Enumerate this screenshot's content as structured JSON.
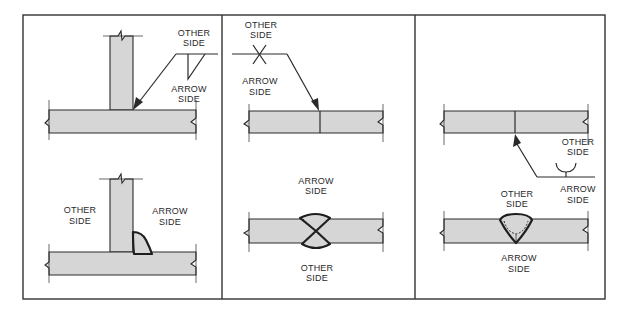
{
  "diagram": {
    "colors": {
      "frame": "#333333",
      "plate_fill": "#d6d6d6",
      "ink": "#2a2a2a",
      "background": "#ffffff"
    },
    "panels": [
      {
        "id": "tee-fillet",
        "description": "T-joint with fillet weld symbol below reference line (arrow side)",
        "symbol": {
          "type": "fillet",
          "position": "below-reference-line",
          "labels": {
            "above": "OTHER SIDE",
            "below": "ARROW SIDE"
          },
          "above_lines": [
            "OTHER",
            "SIDE"
          ],
          "below_lines": [
            "ARROW",
            "SIDE"
          ]
        },
        "joint": {
          "type": "tee-fillet",
          "labels": {
            "left_lines": [
              "OTHER",
              "SIDE"
            ],
            "right_lines": [
              "ARROW",
              "SIDE"
            ]
          }
        }
      },
      {
        "id": "butt-double-v",
        "description": "Butt joint with double-V groove symbol on both sides of reference line",
        "symbol": {
          "type": "double-v-groove",
          "position": "both-sides",
          "above_lines": [
            "OTHER",
            "SIDE"
          ],
          "below_lines": [
            "ARROW",
            "SIDE"
          ]
        },
        "joint": {
          "type": "butt-double-v",
          "labels": {
            "top_lines": [
              "ARROW",
              "SIDE"
            ],
            "bottom_lines": [
              "OTHER",
              "SIDE"
            ]
          }
        }
      },
      {
        "id": "butt-u-groove",
        "description": "Butt joint with U-groove symbol above reference line (other side)",
        "symbol": {
          "type": "u-groove",
          "position": "above-reference-line",
          "above_lines": [
            "OTHER",
            "SIDE"
          ],
          "below_lines": [
            "ARROW",
            "SIDE"
          ]
        },
        "joint": {
          "type": "butt-u-groove",
          "labels": {
            "top_lines": [
              "OTHER",
              "SIDE"
            ],
            "bottom_lines": [
              "ARROW",
              "SIDE"
            ]
          }
        }
      }
    ]
  }
}
